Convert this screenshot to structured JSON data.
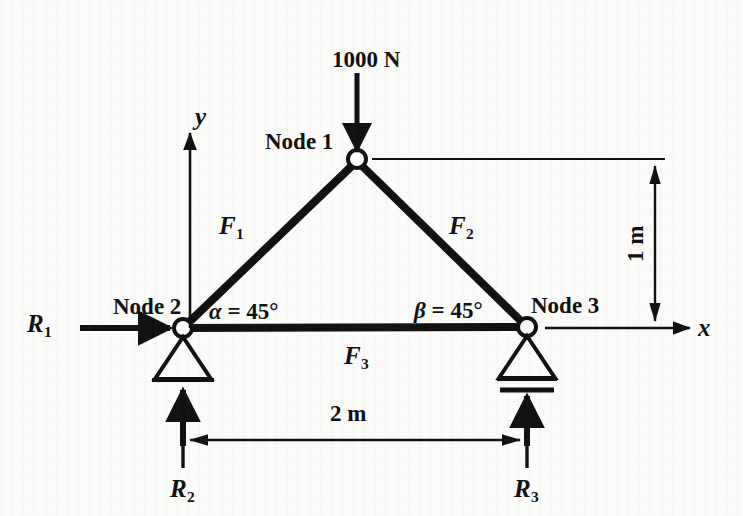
{
  "figure": {
    "kind": "statics-truss-free-body-diagram",
    "background_color": "#fbfbf9",
    "ink_color": "#111111"
  },
  "load": {
    "label": "1000 N",
    "direction": "down",
    "applied_at": "Node 1"
  },
  "axes": {
    "x_label": "x",
    "y_label": "y"
  },
  "nodes": [
    {
      "id": "node-1",
      "label": "Node 1",
      "x_m": 1.0,
      "y_m": 1.0
    },
    {
      "id": "node-2",
      "label": "Node 2",
      "x_m": 0.0,
      "y_m": 0.0
    },
    {
      "id": "node-3",
      "label": "Node 3",
      "x_m": 2.0,
      "y_m": 0.0
    }
  ],
  "members": [
    {
      "id": "member-1",
      "label": "F",
      "subscript": "1",
      "from": "Node 2",
      "to": "Node 1"
    },
    {
      "id": "member-2",
      "label": "F",
      "subscript": "2",
      "from": "Node 1",
      "to": "Node 3"
    },
    {
      "id": "member-3",
      "label": "F",
      "subscript": "3",
      "from": "Node 2",
      "to": "Node 3"
    }
  ],
  "reactions": [
    {
      "id": "reaction-1",
      "label": "R",
      "subscript": "1",
      "direction": "right",
      "at": "Node 2"
    },
    {
      "id": "reaction-2",
      "label": "R",
      "subscript": "2",
      "direction": "up",
      "at": "Node 2"
    },
    {
      "id": "reaction-3",
      "label": "R",
      "subscript": "3",
      "direction": "up",
      "at": "Node 3"
    }
  ],
  "angles": [
    {
      "id": "angle-alpha",
      "symbol": "α",
      "equals": "= 45",
      "degree": "°",
      "at": "Node 2",
      "value_deg": 45
    },
    {
      "id": "angle-beta",
      "symbol": "β",
      "equals": "= 45",
      "degree": "°",
      "at": "Node 3",
      "value_deg": 45
    }
  ],
  "dimensions": [
    {
      "id": "dim-span",
      "label": "2 m",
      "orientation": "horizontal",
      "value_m": 2
    },
    {
      "id": "dim-height",
      "label": "1 m",
      "orientation": "vertical",
      "value_m": 1
    }
  ],
  "supports": [
    {
      "id": "support-pin",
      "at": "Node 2",
      "type": "pin"
    },
    {
      "id": "support-roller",
      "at": "Node 3",
      "type": "roller"
    }
  ]
}
